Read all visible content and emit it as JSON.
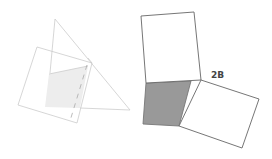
{
  "diagram": {
    "label": "2B",
    "colors": {
      "light_stroke": "#cccccc",
      "light_fill": "#ededed",
      "dark_stroke": "#555555",
      "shaded_fill": "#999999",
      "label": "#444444"
    },
    "left_figure": {
      "triangle": [
        [
          55,
          19
        ],
        [
          130,
          110
        ],
        [
          80,
          108
        ]
      ],
      "square": [
        [
          37,
          47
        ],
        [
          92,
          63
        ],
        [
          77,
          123
        ],
        [
          18,
          105
        ]
      ],
      "shaded_quad": [
        [
          49,
          74
        ],
        [
          88,
          66
        ],
        [
          80,
          108
        ],
        [
          45,
          107
        ]
      ],
      "dashed_fold": [
        [
          87,
          65
        ],
        [
          70,
          121
        ]
      ]
    },
    "right_figure": {
      "top_square": [
        [
          141,
          16
        ],
        [
          194,
          12
        ],
        [
          201,
          80
        ],
        [
          146,
          83
        ]
      ],
      "shaded_quad": [
        [
          146,
          83
        ],
        [
          191,
          81
        ],
        [
          179,
          126
        ],
        [
          143,
          124
        ]
      ],
      "right_rect": [
        [
          201,
          80
        ],
        [
          259,
          99
        ],
        [
          242,
          148
        ],
        [
          179,
          126
        ]
      ]
    }
  }
}
